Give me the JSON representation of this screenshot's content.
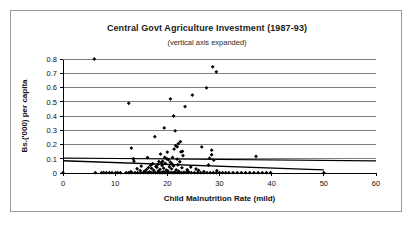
{
  "chart_data": {
    "type": "scatter",
    "title": "Central Govt Agriculture Investment (1987-93)",
    "subtitle": "(vertical axis expanded)",
    "xlabel": "Child Malnutrition Rate (mild)",
    "ylabel": "Bs.('000) per capita",
    "xlim": [
      0,
      60
    ],
    "ylim": [
      0,
      0.8
    ],
    "xticks": [
      0,
      10,
      20,
      30,
      40,
      50,
      60
    ],
    "yticks": [
      0,
      0.1,
      0.2,
      0.3,
      0.4,
      0.5,
      0.6,
      0.7,
      0.8
    ],
    "ytick_labels": [
      "0",
      "0.1",
      "0.2",
      "0.3",
      "0.4",
      "0.5",
      "0.6",
      "0.7",
      "0.8"
    ],
    "xtick_labels": [
      "0",
      "10",
      "20",
      "30",
      "40",
      "50",
      "60"
    ],
    "grid": "horizontal",
    "legend": "none",
    "marker": "diamond",
    "marker_color": "#000000",
    "series": [
      {
        "name": "Central Govt Agriculture Investment per capita",
        "points": [
          [
            6.0,
            0.8
          ],
          [
            28.7,
            0.745
          ],
          [
            29.4,
            0.71
          ],
          [
            27.5,
            0.598
          ],
          [
            24.8,
            0.547
          ],
          [
            20.6,
            0.52
          ],
          [
            12.6,
            0.489
          ],
          [
            23.4,
            0.466
          ],
          [
            21.2,
            0.4
          ],
          [
            19.4,
            0.316
          ],
          [
            21.5,
            0.296
          ],
          [
            17.6,
            0.255
          ],
          [
            22.5,
            0.22
          ],
          [
            22.1,
            0.206
          ],
          [
            21.6,
            0.192
          ],
          [
            21.9,
            0.184
          ],
          [
            26.6,
            0.183
          ],
          [
            13.1,
            0.175
          ],
          [
            21.3,
            0.168
          ],
          [
            28.5,
            0.16
          ],
          [
            22.9,
            0.152
          ],
          [
            22.6,
            0.148
          ],
          [
            20.0,
            0.147
          ],
          [
            18.7,
            0.133
          ],
          [
            28.5,
            0.128
          ],
          [
            23.0,
            0.122
          ],
          [
            37.0,
            0.117
          ],
          [
            19.5,
            0.11
          ],
          [
            21.0,
            0.109
          ],
          [
            16.2,
            0.108
          ],
          [
            28.1,
            0.104
          ],
          [
            13.5,
            0.1
          ],
          [
            19.9,
            0.1
          ],
          [
            21.9,
            0.097
          ],
          [
            20.2,
            0.093
          ],
          [
            28.9,
            0.09
          ],
          [
            13.6,
            0.083
          ],
          [
            19.1,
            0.082
          ],
          [
            18.4,
            0.08
          ],
          [
            22.4,
            0.079
          ],
          [
            20.6,
            0.076
          ],
          [
            18.9,
            0.072
          ],
          [
            19.6,
            0.068
          ],
          [
            17.2,
            0.065
          ],
          [
            20.9,
            0.063
          ],
          [
            18.2,
            0.06
          ],
          [
            22.0,
            0.058
          ],
          [
            27.9,
            0.056
          ],
          [
            16.8,
            0.054
          ],
          [
            19.0,
            0.052
          ],
          [
            21.2,
            0.05
          ],
          [
            15.0,
            0.048
          ],
          [
            17.8,
            0.046
          ],
          [
            20.4,
            0.044
          ],
          [
            24.5,
            0.042
          ],
          [
            18.0,
            0.04
          ],
          [
            16.4,
            0.038
          ],
          [
            22.8,
            0.036
          ],
          [
            19.3,
            0.034
          ],
          [
            17.0,
            0.032
          ],
          [
            14.2,
            0.03
          ],
          [
            20.8,
            0.029
          ],
          [
            25.5,
            0.028
          ],
          [
            18.6,
            0.026
          ],
          [
            16.0,
            0.024
          ],
          [
            23.8,
            0.023
          ],
          [
            21.7,
            0.022
          ],
          [
            19.8,
            0.02
          ],
          [
            17.4,
            0.019
          ],
          [
            26.0,
            0.018
          ],
          [
            14.8,
            0.017
          ],
          [
            29.5,
            0.016
          ],
          [
            18.3,
            0.015
          ],
          [
            20.1,
            0.014
          ],
          [
            22.2,
            0.013
          ],
          [
            15.6,
            0.012
          ],
          [
            24.0,
            0.011
          ],
          [
            27.0,
            0.01
          ],
          [
            13.0,
            0.009
          ],
          [
            19.2,
            0.008
          ],
          [
            16.6,
            0.007
          ],
          [
            21.4,
            0.006
          ],
          [
            23.2,
            0.005
          ],
          [
            6.2,
            0.002
          ],
          [
            7.4,
            0.002
          ],
          [
            7.8,
            0.002
          ],
          [
            8.3,
            0.002
          ],
          [
            8.9,
            0.002
          ],
          [
            9.4,
            0.002
          ],
          [
            10.1,
            0.002
          ],
          [
            10.5,
            0.002
          ],
          [
            11.0,
            0.002
          ],
          [
            12.1,
            0.002
          ],
          [
            12.6,
            0.002
          ],
          [
            13.2,
            0.002
          ],
          [
            13.8,
            0.002
          ],
          [
            14.3,
            0.002
          ],
          [
            14.9,
            0.002
          ],
          [
            15.4,
            0.002
          ],
          [
            15.9,
            0.002
          ],
          [
            16.3,
            0.002
          ],
          [
            16.9,
            0.002
          ],
          [
            17.3,
            0.002
          ],
          [
            17.7,
            0.002
          ],
          [
            18.1,
            0.002
          ],
          [
            18.5,
            0.002
          ],
          [
            18.8,
            0.002
          ],
          [
            19.1,
            0.002
          ],
          [
            19.4,
            0.002
          ],
          [
            19.7,
            0.002
          ],
          [
            20.0,
            0.002
          ],
          [
            20.3,
            0.002
          ],
          [
            20.7,
            0.002
          ],
          [
            21.1,
            0.002
          ],
          [
            21.5,
            0.002
          ],
          [
            21.9,
            0.002
          ],
          [
            22.3,
            0.002
          ],
          [
            22.7,
            0.002
          ],
          [
            23.1,
            0.002
          ],
          [
            23.6,
            0.002
          ],
          [
            24.1,
            0.002
          ],
          [
            24.6,
            0.002
          ],
          [
            25.2,
            0.002
          ],
          [
            25.8,
            0.002
          ],
          [
            26.4,
            0.002
          ],
          [
            27.0,
            0.002
          ],
          [
            27.6,
            0.002
          ],
          [
            28.2,
            0.002
          ],
          [
            28.8,
            0.002
          ],
          [
            29.4,
            0.002
          ],
          [
            30.0,
            0.002
          ],
          [
            30.6,
            0.002
          ],
          [
            31.2,
            0.002
          ],
          [
            31.8,
            0.002
          ],
          [
            32.6,
            0.002
          ],
          [
            33.4,
            0.002
          ],
          [
            34.2,
            0.002
          ],
          [
            35.0,
            0.002
          ],
          [
            35.8,
            0.002
          ],
          [
            36.6,
            0.002
          ],
          [
            37.4,
            0.002
          ],
          [
            38.2,
            0.002
          ],
          [
            39.0,
            0.002
          ],
          [
            39.8,
            0.002
          ],
          [
            50.0,
            0.002
          ],
          [
            0.0,
            0.002
          ]
        ]
      }
    ],
    "trendlines": [
      {
        "name": "trendline-upper",
        "from": [
          0,
          0.105
        ],
        "to": [
          60,
          0.085
        ],
        "color": "#000000",
        "width": 1.1
      },
      {
        "name": "trendline-lower",
        "from": [
          0,
          0.086
        ],
        "to": [
          50,
          0.022
        ],
        "color": "#000000",
        "width": 1.4
      }
    ]
  }
}
